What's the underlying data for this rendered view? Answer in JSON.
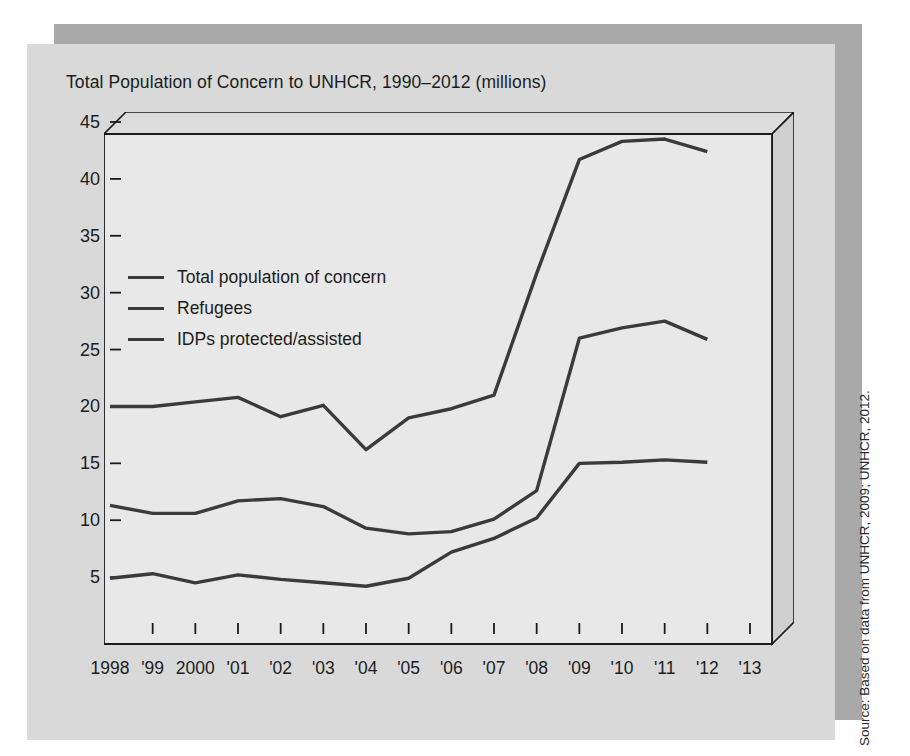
{
  "figure": {
    "title": "Total Population of Concern to UNHCR, 1990–2012 (millions)",
    "source": "Source: Based on data from UNHCR, 2009; UNHCR, 2012.",
    "panel_color": "#d9d9d9",
    "shadow_color": "#a9a9a9",
    "plot_face_color": "#e8e8e8",
    "line_color": "#3a3a3a",
    "axis_color": "#1a1a1a"
  },
  "chart_data": {
    "type": "line",
    "title": "Total Population of Concern to UNHCR, 1990–2012 (millions)",
    "xlabel": "",
    "ylabel": "millions",
    "ylim": [
      0,
      45
    ],
    "yticks": [
      5,
      10,
      15,
      20,
      25,
      30,
      35,
      40,
      45
    ],
    "ytick_labels": [
      "5",
      "10",
      "15",
      "20",
      "25",
      "30",
      "35",
      "40",
      "45"
    ],
    "grid": false,
    "legend_position": "upper left",
    "x": [
      1998,
      1999,
      2000,
      2001,
      2002,
      2003,
      2004,
      2005,
      2006,
      2007,
      2008,
      2009,
      2010,
      2011,
      2012
    ],
    "xtick_labels": [
      "1998",
      "'99",
      "2000",
      "'01",
      "'02",
      "'03",
      "'04",
      "'05",
      "'06",
      "'07",
      "'08",
      "'09",
      "'10",
      "'11",
      "'12",
      "'13"
    ],
    "series": [
      {
        "name": "Total population of concern",
        "values": [
          20.0,
          20.0,
          20.4,
          20.8,
          19.1,
          20.1,
          16.2,
          19.0,
          19.8,
          21.0,
          31.7,
          41.7,
          43.3,
          43.5,
          42.4
        ]
      },
      {
        "name": "Refugees",
        "values": [
          11.3,
          10.6,
          10.6,
          11.7,
          11.9,
          11.2,
          9.3,
          8.8,
          9.0,
          10.1,
          12.6,
          26.0,
          26.9,
          27.5,
          25.9
        ]
      },
      {
        "name": "IDPs protected/assisted",
        "values": [
          4.9,
          5.3,
          4.5,
          5.2,
          4.8,
          4.5,
          4.2,
          4.9,
          7.2,
          8.4,
          10.2,
          15.0,
          15.1,
          15.3,
          15.1
        ]
      }
    ]
  },
  "legend": {
    "items": [
      {
        "label": "Total population of concern"
      },
      {
        "label": "Refugees"
      },
      {
        "label": "IDPs protected/assisted"
      }
    ]
  }
}
